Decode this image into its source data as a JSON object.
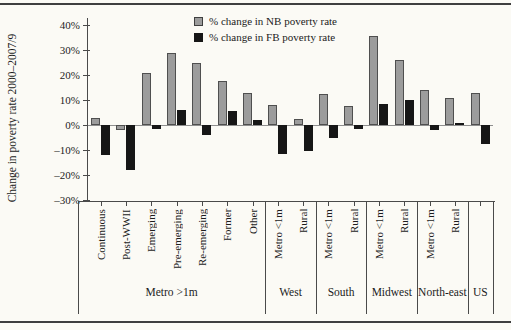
{
  "figure": {
    "ylabel": "Change in poverty rate 2000–2007/9"
  },
  "legend": {
    "items": [
      {
        "label": "% change in NB poverty rate",
        "swatch": "nb"
      },
      {
        "label": "% change in FB poverty rate",
        "swatch": "fb"
      }
    ]
  },
  "colors": {
    "nb_bar": "#9c9c9c",
    "nb_border": "#4f4f4f",
    "fb_bar": "#161616",
    "axis": "#4a4a4a",
    "zero_line": "#8f8f8f",
    "background": "#fbfaf5",
    "rule": "#3f3f3f"
  },
  "chart_data": {
    "type": "bar",
    "title": "",
    "ylabel": "Change in poverty rate 2000–2007/9",
    "ylim": [
      -30,
      40
    ],
    "ytick_interval": 10,
    "ytick_labels": [
      "40%",
      "30%",
      "20%",
      "10%",
      "0%",
      "–10%",
      "–20%",
      "–30%"
    ],
    "grid": false,
    "legend_position": "top",
    "categories": [
      "Continuous",
      "Post-WWII",
      "Emerging",
      "Pre-emerging",
      "Re-emerging",
      "Former",
      "Other",
      "Metro <1m",
      "Rural",
      "Metro <1m",
      "Rural",
      "Metro <1m",
      "Rural",
      "Metro <1m",
      "Rural",
      ""
    ],
    "groups": [
      {
        "label": "Metro >1m",
        "span": 7
      },
      {
        "label": "West",
        "span": 2
      },
      {
        "label": "South",
        "span": 2
      },
      {
        "label": "Midwest",
        "span": 2
      },
      {
        "label": "North-east",
        "span": 2
      },
      {
        "label": "US",
        "span": 1
      }
    ],
    "series": [
      {
        "name": "% change in NB poverty rate",
        "color": "#9c9c9c",
        "values": [
          3,
          -2,
          21,
          29,
          25,
          17.5,
          13,
          8,
          2.5,
          12.5,
          7.5,
          35.5,
          26,
          14,
          11,
          13
        ]
      },
      {
        "name": "% change in FB poverty rate",
        "color": "#161616",
        "values": [
          -12,
          -18,
          -1.5,
          6,
          -4,
          5.5,
          2,
          -11.5,
          -10.5,
          -5,
          -1.5,
          8.5,
          10,
          -2,
          1,
          -7.5
        ]
      }
    ]
  }
}
